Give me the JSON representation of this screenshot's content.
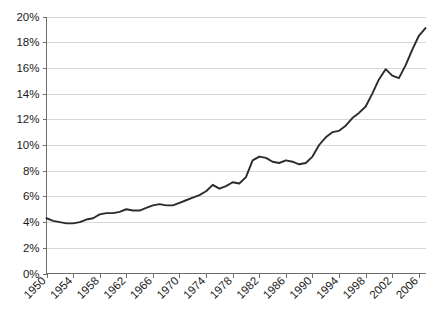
{
  "chart_data": {
    "type": "line",
    "title": "",
    "subtitle": "",
    "xlabel": "",
    "ylabel": "",
    "xlim": [
      1950,
      2007
    ],
    "ylim": [
      0,
      20
    ],
    "grid": true,
    "legend": false,
    "y_tick_labels": [
      "0%",
      "2%",
      "4%",
      "6%",
      "8%",
      "10%",
      "12%",
      "14%",
      "16%",
      "18%",
      "20%"
    ],
    "y_tick_values": [
      0,
      2,
      4,
      6,
      8,
      10,
      12,
      14,
      16,
      18,
      20
    ],
    "x_tick_labels": [
      "1950",
      "1954",
      "1958",
      "1962",
      "1966",
      "1970",
      "1974",
      "1978",
      "1982",
      "1986",
      "1990",
      "1994",
      "1998",
      "2002",
      "2006"
    ],
    "x_tick_values": [
      1950,
      1954,
      1958,
      1962,
      1966,
      1970,
      1974,
      1978,
      1982,
      1986,
      1990,
      1994,
      1998,
      2002,
      2006
    ],
    "x_tick_rotation": -45,
    "series": [
      {
        "name": "value",
        "color": "#2b2b2b",
        "x": [
          1950,
          1951,
          1952,
          1953,
          1954,
          1955,
          1956,
          1957,
          1958,
          1959,
          1960,
          1961,
          1962,
          1963,
          1964,
          1965,
          1966,
          1967,
          1968,
          1969,
          1970,
          1971,
          1972,
          1973,
          1974,
          1975,
          1976,
          1977,
          1978,
          1979,
          1980,
          1981,
          1982,
          1983,
          1984,
          1985,
          1986,
          1987,
          1988,
          1989,
          1990,
          1991,
          1992,
          1993,
          1994,
          1995,
          1996,
          1997,
          1998,
          1999,
          2000,
          2001,
          2002,
          2003,
          2004,
          2005,
          2006,
          2007
        ],
        "y": [
          4.3,
          4.1,
          4.0,
          3.9,
          3.9,
          4.0,
          4.2,
          4.3,
          4.6,
          4.7,
          4.7,
          4.8,
          5.0,
          4.9,
          4.9,
          5.1,
          5.3,
          5.4,
          5.3,
          5.3,
          5.5,
          5.7,
          5.9,
          6.1,
          6.4,
          6.9,
          6.6,
          6.8,
          7.1,
          7.0,
          7.5,
          8.8,
          9.1,
          9.0,
          8.7,
          8.6,
          8.8,
          8.7,
          8.5,
          8.6,
          9.1,
          10.0,
          10.6,
          11.0,
          11.1,
          11.5,
          12.1,
          12.5,
          13.0,
          14.0,
          15.1,
          15.9,
          15.4,
          15.2,
          16.2,
          17.4,
          18.5,
          19.1
        ]
      }
    ]
  }
}
